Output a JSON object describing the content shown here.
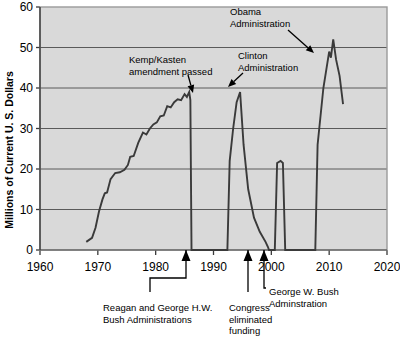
{
  "chart_data": {
    "type": "line",
    "title": "",
    "xlabel": "",
    "ylabel": "Millions of Current U. S. Dollars",
    "xlim": [
      1960,
      2020
    ],
    "ylim": [
      0,
      60
    ],
    "xticks": [
      1960,
      1970,
      1980,
      1990,
      2000,
      2010,
      2020
    ],
    "xtick_labels": [
      "1960",
      "1970",
      "1980",
      "1990",
      "2000",
      "2010",
      "2020"
    ],
    "yticks": [
      0,
      10,
      20,
      30,
      40,
      50,
      60
    ],
    "ytick_labels": [
      "0",
      "10",
      "20",
      "30",
      "40",
      "50",
      "60"
    ],
    "grid": "horizontal",
    "legend": "none",
    "plot_background": "#d9d9d9",
    "line_color": "#3a3a3a",
    "series": [
      {
        "name": "Funding",
        "x": [
          1968.0,
          1969.0,
          1969.6,
          1970.2,
          1970.8,
          1971.2,
          1971.6,
          1972.2,
          1973.0,
          1973.8,
          1974.6,
          1975.2,
          1975.6,
          1976.2,
          1977.0,
          1977.8,
          1978.4,
          1979.0,
          1979.6,
          1980.2,
          1980.8,
          1981.4,
          1982.0,
          1982.6,
          1983.2,
          1983.8,
          1984.4,
          1985.0,
          1985.4,
          1985.8,
          1986.0,
          1986.2,
          1992.4,
          1992.8,
          1993.4,
          1994.0,
          1994.6,
          1995.2,
          1996.0,
          1997.0,
          1998.0,
          1999.0,
          1999.4,
          1999.6,
          2000.6,
          2001.0,
          2001.6,
          2002.0,
          2002.4,
          2007.6,
          2008.0,
          2009.0,
          2010.0,
          2010.3,
          2010.7,
          2011.2,
          2011.8,
          2012.4
        ],
        "y": [
          2.0,
          3.0,
          5.5,
          9.5,
          12.5,
          14.0,
          14.2,
          17.5,
          19.0,
          19.2,
          19.8,
          21.0,
          23.0,
          23.2,
          26.5,
          29.0,
          28.5,
          30.0,
          31.0,
          31.5,
          33.0,
          33.2,
          35.5,
          35.2,
          36.5,
          37.2,
          37.0,
          38.5,
          37.8,
          39.0,
          37.0,
          0.0,
          0.0,
          22.0,
          30.0,
          36.5,
          39.0,
          26.0,
          15.0,
          8.0,
          4.5,
          2.0,
          0.8,
          0.0,
          0.0,
          21.5,
          22.0,
          21.5,
          0.0,
          0.0,
          26.0,
          40.0,
          49.0,
          47.5,
          52.0,
          47.0,
          43.0,
          36.0
        ]
      }
    ],
    "annotations": [
      {
        "id": "kemp-kasten",
        "lines": [
          "Kemp/Kasten",
          "amendment passed"
        ],
        "text_x": 129,
        "text_y": 52,
        "arrow": {
          "x1": 188,
          "y1": 75,
          "x2": 193,
          "y2": 93
        }
      },
      {
        "id": "clinton",
        "lines": [
          "Clinton",
          "Administration"
        ],
        "text_x": 238,
        "text_y": 48,
        "arrow": {
          "x1": 243,
          "y1": 73,
          "x2": 228,
          "y2": 87
        }
      },
      {
        "id": "obama",
        "lines": [
          "Obama",
          "Administration"
        ],
        "text_x": 230,
        "text_y": 4,
        "arrow": {
          "x1": 288,
          "y1": 30,
          "x2": 314,
          "y2": 53
        }
      },
      {
        "id": "reagan-bush",
        "lines": [
          "Reagan and George H.W.",
          "Bush Administrations"
        ],
        "text_x": 103,
        "text_y": 300,
        "marker_x": 186,
        "leader": "M186,250 L186,278 L150,278 L150,292"
      },
      {
        "id": "congress-eliminated",
        "lines": [
          "Congress",
          "eliminated",
          "funding"
        ],
        "text_x": 229,
        "text_y": 300,
        "marker_x": 248,
        "leader": "M248,250 L248,292"
      },
      {
        "id": "gw-bush",
        "lines": [
          "George W. Bush",
          "Adminstration"
        ],
        "text_x": 269,
        "text_y": 284,
        "marker_x": 264,
        "leader": "M264,250 L264,288 L266,288"
      }
    ]
  }
}
